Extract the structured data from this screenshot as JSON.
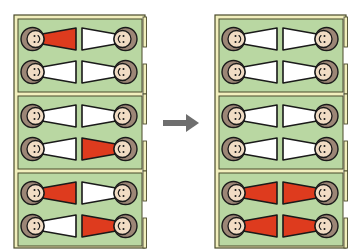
{
  "diagram": {
    "colors": {
      "background": "#ffffff",
      "room_floor": "#b9d7a2",
      "wall_fill": "#f1efbd",
      "wall_outline": "#4a4a2a",
      "gown_red": "#de3b1e",
      "gown_white": "#ffffff",
      "skin": "#f1dcc4",
      "hair": "#9c8676",
      "outline": "#1a1a1a",
      "arrow": "#6e6e6e"
    },
    "arrow": {
      "direction": "right",
      "icon": "arrow-right-icon"
    },
    "buildings": [
      {
        "label": "before",
        "rooms": [
          {
            "beds": [
              {
                "pos": "top-left",
                "gown": "red"
              },
              {
                "pos": "top-right",
                "gown": "white"
              },
              {
                "pos": "bottom-left",
                "gown": "white"
              },
              {
                "pos": "bottom-right",
                "gown": "white"
              }
            ]
          },
          {
            "beds": [
              {
                "pos": "top-left",
                "gown": "white"
              },
              {
                "pos": "top-right",
                "gown": "white"
              },
              {
                "pos": "bottom-left",
                "gown": "white"
              },
              {
                "pos": "bottom-right",
                "gown": "red"
              }
            ]
          },
          {
            "beds": [
              {
                "pos": "top-left",
                "gown": "red"
              },
              {
                "pos": "top-right",
                "gown": "white"
              },
              {
                "pos": "bottom-left",
                "gown": "white"
              },
              {
                "pos": "bottom-right",
                "gown": "red"
              }
            ]
          }
        ]
      },
      {
        "label": "after",
        "rooms": [
          {
            "beds": [
              {
                "pos": "top-left",
                "gown": "white"
              },
              {
                "pos": "top-right",
                "gown": "white"
              },
              {
                "pos": "bottom-left",
                "gown": "white"
              },
              {
                "pos": "bottom-right",
                "gown": "white"
              }
            ]
          },
          {
            "beds": [
              {
                "pos": "top-left",
                "gown": "white"
              },
              {
                "pos": "top-right",
                "gown": "white"
              },
              {
                "pos": "bottom-left",
                "gown": "white"
              },
              {
                "pos": "bottom-right",
                "gown": "white"
              }
            ]
          },
          {
            "beds": [
              {
                "pos": "top-left",
                "gown": "red"
              },
              {
                "pos": "top-right",
                "gown": "red"
              },
              {
                "pos": "bottom-left",
                "gown": "red"
              },
              {
                "pos": "bottom-right",
                "gown": "red"
              }
            ]
          }
        ]
      }
    ]
  }
}
